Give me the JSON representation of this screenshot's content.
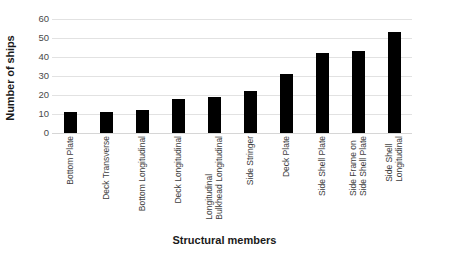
{
  "chart_data": {
    "type": "bar",
    "title": "",
    "xlabel": "Structural members",
    "ylabel": "Number of ships",
    "ylim": [
      0,
      60
    ],
    "yticks": [
      0,
      10,
      20,
      30,
      40,
      50,
      60
    ],
    "grid": true,
    "legend": "none",
    "bar_color": "#000000",
    "gridline_color": "#e2e2e2",
    "categories": [
      "Bottom Plate",
      "Deck Transverse",
      "Bottom Longitudinal",
      "Deck Longitudinal",
      "Longitudinal Bulkhead Longitudinal",
      "Side Stringer",
      "Deck Plate",
      "Side Shell Plate",
      "Side Frame on Side Shell Plate",
      "Side Shell Longitudinal"
    ],
    "category_lines": [
      [
        "Bottom Plate",
        ""
      ],
      [
        "Deck Transverse",
        ""
      ],
      [
        "Bottom Longitudinal",
        ""
      ],
      [
        "Deck Longitudinal",
        ""
      ],
      [
        "Longitudinal",
        "Bulkhead Longitudinal"
      ],
      [
        "Side Stringer",
        ""
      ],
      [
        "Deck Plate",
        ""
      ],
      [
        "Side Shell Plate",
        ""
      ],
      [
        "Side Frame on",
        "Side Shell Plate"
      ],
      [
        "Side Shell",
        "Longitudinal"
      ]
    ],
    "values": [
      11,
      11,
      12,
      18,
      19,
      22,
      31,
      42,
      43,
      53
    ]
  }
}
